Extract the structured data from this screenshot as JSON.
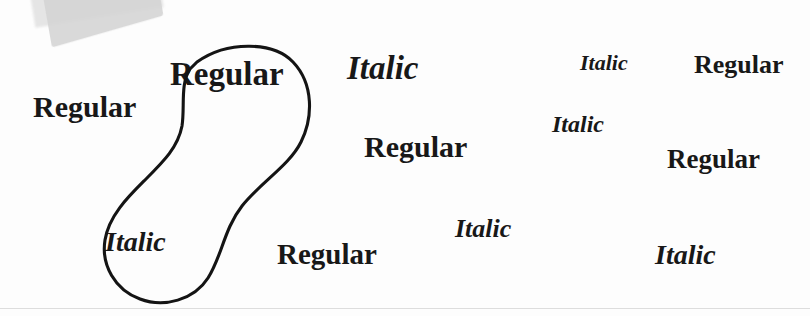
{
  "page": {
    "background_color": "#fdfdfd",
    "ink_color": "#181818",
    "annotation_color": "#141414",
    "artifact_color": "#d5d5d5",
    "rule_color": "#d8d8d8",
    "width": 810,
    "height": 316
  },
  "annotation": {
    "label": "hand-drawn peanut shaped circling of two specimen words",
    "shape": "figure-eight-lasso",
    "encloses": [
      "Regular",
      "Italic"
    ],
    "path": "M 137 38 C 168 16, 214 18, 233 38 C 254 60, 253 94, 241 118 C 229 142, 201 158, 182 182 C 164 205, 162 232, 148 254 C 134 276, 104 284, 80 275 C 55 266, 41 241, 45 216 C 49 191, 69 172, 86 155 C 104 137, 118 123, 122 102 C 125 83, 120 60, 130 45 Z"
  },
  "specimens": [
    {
      "text": "Regular",
      "style": "regular",
      "x": 33,
      "y": 92,
      "size": 30,
      "rotation": 0
    },
    {
      "text": "Regular",
      "style": "regular",
      "x": 170,
      "y": 58,
      "size": 33,
      "rotation": 0
    },
    {
      "text": "Italic",
      "style": "italic",
      "x": 347,
      "y": 52,
      "size": 33,
      "rotation": 0
    },
    {
      "text": "Italic",
      "style": "italic",
      "x": 580,
      "y": 52,
      "size": 22,
      "rotation": 0
    },
    {
      "text": "Regular",
      "style": "regular",
      "x": 694,
      "y": 52,
      "size": 26,
      "rotation": 0
    },
    {
      "text": "Italic",
      "style": "italic",
      "x": 552,
      "y": 112,
      "size": 24,
      "rotation": 0
    },
    {
      "text": "Regular",
      "style": "regular",
      "x": 364,
      "y": 132,
      "size": 30,
      "rotation": 0
    },
    {
      "text": "Regular",
      "style": "regular",
      "x": 667,
      "y": 146,
      "size": 27,
      "rotation": 0
    },
    {
      "text": "Italic",
      "style": "italic",
      "x": 455,
      "y": 216,
      "size": 26,
      "rotation": 0
    },
    {
      "text": "Italic",
      "style": "italic",
      "x": 105,
      "y": 228,
      "size": 28,
      "rotation": 0
    },
    {
      "text": "Regular",
      "style": "regular",
      "x": 277,
      "y": 240,
      "size": 29,
      "rotation": 0
    },
    {
      "text": "Italic",
      "style": "italic",
      "x": 655,
      "y": 241,
      "size": 28,
      "rotation": 0
    }
  ]
}
